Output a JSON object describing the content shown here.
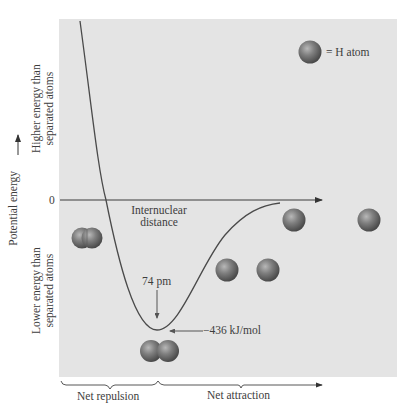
{
  "diagram": {
    "type": "potential-energy-curve",
    "y_axis": {
      "label": "Potential energy",
      "zero_label": "0",
      "upper_region_label_line1": "Higher energy than",
      "upper_region_label_line2": "separated atoms",
      "lower_region_label_line1": "Lower energy than",
      "lower_region_label_line2": "separated atoms"
    },
    "x_axis": {
      "label_line1": "Internuclear",
      "label_line2": "distance"
    },
    "legend": {
      "symbol": "H atom sphere",
      "label": "= H atom"
    },
    "annotations": {
      "bond_length": "74 pm",
      "bond_energy": "−436 kJ/mol"
    },
    "regions": {
      "left": "Net repulsion",
      "right": "Net attraction"
    },
    "colors": {
      "panel_bg": "#e4e4e4",
      "curve": "#4a4a4a",
      "atom": "#7a7a7a",
      "text": "#3d3d3d"
    }
  }
}
